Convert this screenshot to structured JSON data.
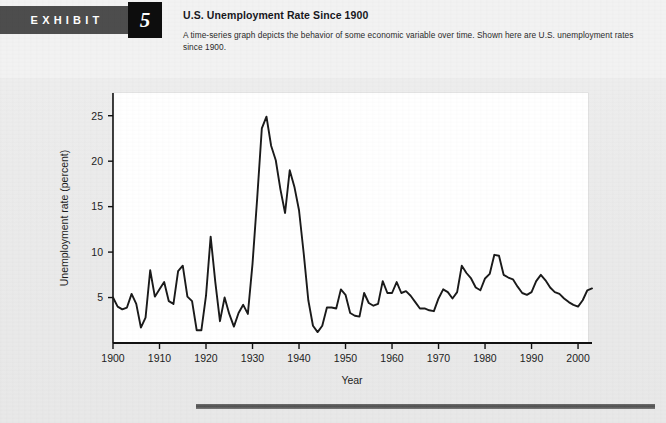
{
  "exhibit": {
    "label": "EXHIBIT",
    "number": "5",
    "title": "U.S. Unemployment Rate Since 1900",
    "description": "A time-series graph depicts the behavior of some economic variable over time. Shown here are U.S. unemployment rates since 1900."
  },
  "colors": {
    "page_background": "#ececec",
    "tag_background": "#4d4d4d",
    "number_background": "#0d0d0d",
    "plot_background": "#ffffff",
    "line": "#1a1a1a",
    "axis": "#111111",
    "rule": "#5a5a5a"
  },
  "chart_data": {
    "type": "line",
    "title": "U.S. Unemployment Rate Since 1900",
    "xlabel": "Year",
    "ylabel": "Unemployment rate (percent)",
    "xlim": [
      1900,
      2003
    ],
    "ylim": [
      0,
      27.5
    ],
    "xticks": [
      1900,
      1910,
      1920,
      1930,
      1940,
      1950,
      1960,
      1970,
      1980,
      1990,
      2000
    ],
    "xtick_labels": [
      "1900",
      "1910",
      "1920",
      "1930",
      "1940",
      "1950",
      "1960",
      "1970",
      "1980",
      "1990",
      "2000"
    ],
    "yticks": [
      5,
      10,
      15,
      20,
      25
    ],
    "ytick_labels": [
      "5",
      "10",
      "15",
      "20",
      "25"
    ],
    "grid": false,
    "legend": null,
    "series": [
      {
        "name": "U.S. unemployment rate",
        "x": [
          1900,
          1901,
          1902,
          1903,
          1904,
          1905,
          1906,
          1907,
          1908,
          1909,
          1910,
          1911,
          1912,
          1913,
          1914,
          1915,
          1916,
          1917,
          1918,
          1919,
          1920,
          1921,
          1922,
          1923,
          1924,
          1925,
          1926,
          1927,
          1928,
          1929,
          1930,
          1931,
          1932,
          1933,
          1934,
          1935,
          1936,
          1937,
          1938,
          1939,
          1940,
          1941,
          1942,
          1943,
          1944,
          1945,
          1946,
          1947,
          1948,
          1949,
          1950,
          1951,
          1952,
          1953,
          1954,
          1955,
          1956,
          1957,
          1958,
          1959,
          1960,
          1961,
          1962,
          1963,
          1964,
          1965,
          1966,
          1967,
          1968,
          1969,
          1970,
          1971,
          1972,
          1973,
          1974,
          1975,
          1976,
          1977,
          1978,
          1979,
          1980,
          1981,
          1982,
          1983,
          1984,
          1985,
          1986,
          1987,
          1988,
          1989,
          1990,
          1991,
          1992,
          1993,
          1994,
          1995,
          1996,
          1997,
          1998,
          1999,
          2000,
          2001,
          2002,
          2003
        ],
        "values": [
          5.0,
          4.0,
          3.7,
          3.9,
          5.4,
          4.3,
          1.7,
          2.8,
          8.0,
          5.1,
          5.9,
          6.7,
          4.6,
          4.3,
          7.9,
          8.5,
          5.1,
          4.6,
          1.4,
          1.4,
          5.2,
          11.7,
          6.7,
          2.4,
          5.0,
          3.2,
          1.8,
          3.3,
          4.2,
          3.2,
          8.7,
          15.9,
          23.6,
          24.9,
          21.7,
          20.1,
          16.9,
          14.3,
          19.0,
          17.2,
          14.6,
          9.9,
          4.7,
          1.9,
          1.2,
          1.9,
          3.9,
          3.9,
          3.8,
          5.9,
          5.3,
          3.3,
          3.0,
          2.9,
          5.5,
          4.4,
          4.1,
          4.3,
          6.8,
          5.5,
          5.5,
          6.7,
          5.5,
          5.7,
          5.2,
          4.5,
          3.8,
          3.8,
          3.6,
          3.5,
          4.9,
          5.9,
          5.6,
          4.9,
          5.6,
          8.5,
          7.7,
          7.1,
          6.1,
          5.8,
          7.1,
          7.6,
          9.7,
          9.6,
          7.5,
          7.2,
          7.0,
          6.2,
          5.5,
          5.3,
          5.6,
          6.8,
          7.5,
          6.9,
          6.1,
          5.6,
          5.4,
          4.9,
          4.5,
          4.2,
          4.0,
          4.7,
          5.8,
          6.0
        ]
      }
    ]
  }
}
